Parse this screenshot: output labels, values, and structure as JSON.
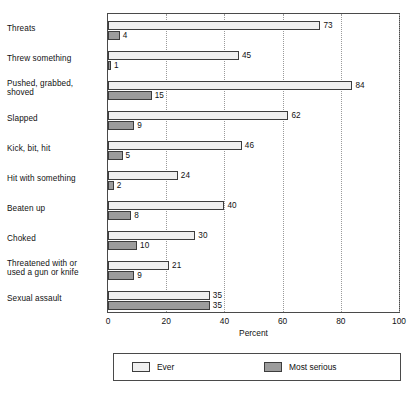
{
  "chart_data": {
    "type": "bar",
    "orientation": "horizontal",
    "title": "",
    "xlabel": "Percent",
    "ylabel": "",
    "xlim": [
      0,
      100
    ],
    "xticks": [
      0,
      20,
      40,
      60,
      80,
      100
    ],
    "xtick_labels": [
      "0",
      "20",
      "40",
      "60",
      "80",
      "100"
    ],
    "grid": "vertical-dotted",
    "legend_position": "bottom",
    "categories": [
      "Threats",
      "Threw something",
      "Pushed, grabbed, shoved",
      "Slapped",
      "Kick, bit, hit",
      "Hit with something",
      "Beaten up",
      "Choked",
      "Threatened with or used a gun or knife",
      "Sexual assault"
    ],
    "category_lines": [
      [
        "Threats"
      ],
      [
        "Threw something"
      ],
      [
        "Pushed, grabbed,",
        "shoved"
      ],
      [
        "Slapped"
      ],
      [
        "Kick, bit, hit"
      ],
      [
        "Hit with something"
      ],
      [
        "Beaten up"
      ],
      [
        "Choked"
      ],
      [
        "Threatened with or",
        "used a gun or knife"
      ],
      [
        "Sexual assault"
      ]
    ],
    "series": [
      {
        "name": "Ever",
        "color": "#efefef",
        "values": [
          73,
          45,
          84,
          62,
          46,
          24,
          40,
          30,
          21,
          35
        ],
        "labels": [
          "73",
          "45",
          "84",
          "62",
          "46",
          "24",
          "40",
          "30",
          "21",
          "35"
        ]
      },
      {
        "name": "Most serious",
        "color": "#9c9c9c",
        "values": [
          4,
          1,
          15,
          9,
          5,
          2,
          8,
          10,
          9,
          35
        ],
        "labels": [
          "4",
          "1",
          "15",
          "9",
          "5",
          "2",
          "8",
          "10",
          "9",
          "35"
        ]
      }
    ]
  },
  "axis": {
    "x_title": "Percent",
    "tick_labels": [
      "0",
      "20",
      "40",
      "60",
      "80",
      "100"
    ]
  },
  "legend": {
    "items": [
      {
        "label": "Ever",
        "color": "#efefef"
      },
      {
        "label": "Most serious",
        "color": "#9c9c9c"
      }
    ]
  }
}
